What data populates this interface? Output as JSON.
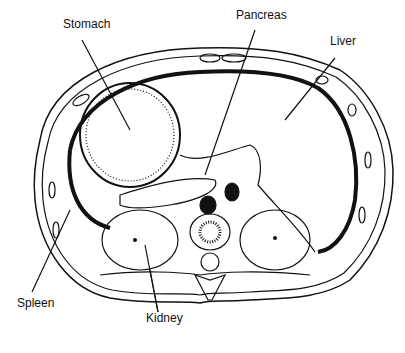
{
  "diagram": {
    "type": "anatomical cross-section",
    "labels": [
      {
        "id": "stomach",
        "text": "Stomach",
        "x": 63,
        "y": 24
      },
      {
        "id": "pancreas",
        "text": "Pancreas",
        "x": 236,
        "y": 15
      },
      {
        "id": "liver",
        "text": "Liver",
        "x": 330,
        "y": 41
      },
      {
        "id": "spleen",
        "text": "Spleen",
        "x": 17,
        "y": 303
      },
      {
        "id": "kidney",
        "text": "Kidney",
        "x": 146,
        "y": 318
      }
    ],
    "colors": {
      "ink": "#111111",
      "background": "#ffffff"
    }
  }
}
